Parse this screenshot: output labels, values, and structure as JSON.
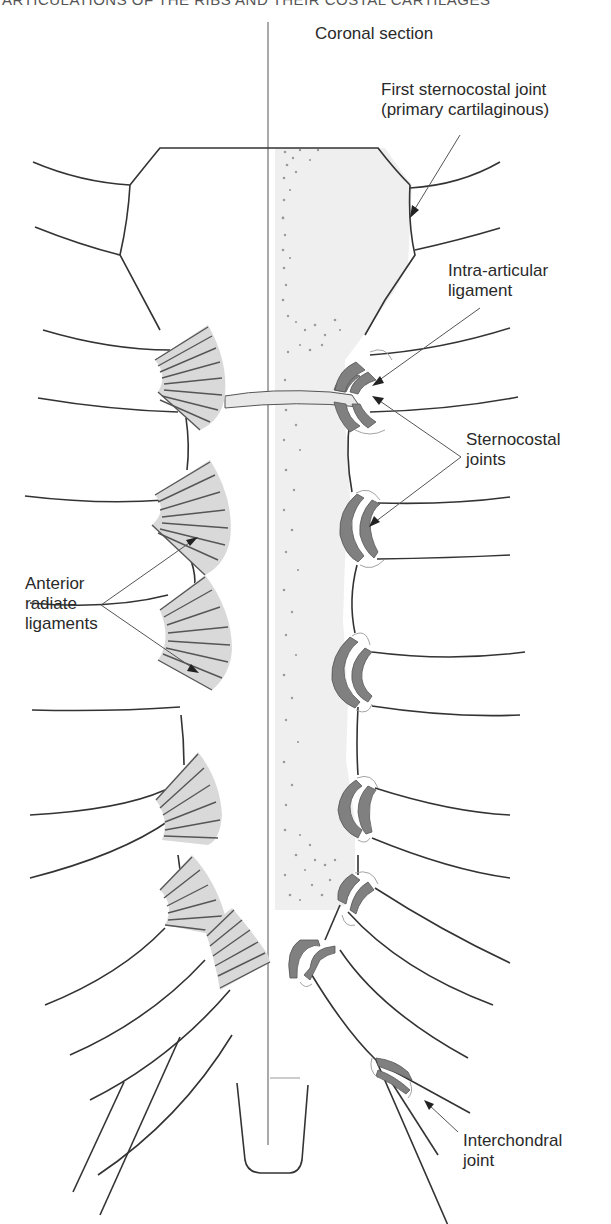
{
  "header": {
    "running_title": "ARTICULATIONS OF THE RIBS AND THEIR COSTAL CARTILAGES"
  },
  "diagram": {
    "section_title": "Coronal section",
    "labels": {
      "first_sternocostal": [
        "First sternocostal joint",
        "(primary cartilaginous)"
      ],
      "intra_articular": [
        "Intra-articular",
        "ligament"
      ],
      "sternocostal": [
        "Sternocostal",
        "joints"
      ],
      "anterior_radiate": [
        "Anterior",
        "radiate",
        "ligaments"
      ],
      "interchondral": [
        "Interchondral",
        "joint"
      ]
    },
    "colors": {
      "outline": "#333333",
      "ligament_fill": "#d9d9d9",
      "cartilage_fill": "#808080",
      "sternum_section_fill": "#efefef",
      "stipple": "#9a9a9a"
    }
  }
}
